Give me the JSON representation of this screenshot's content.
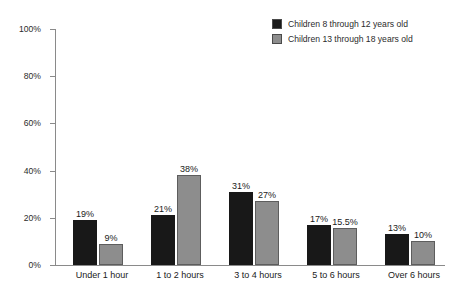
{
  "chart_data": {
    "type": "bar",
    "title": "",
    "xlabel": "",
    "ylabel": "",
    "grid": false,
    "legend_position": "top-right",
    "ylim": [
      0,
      100
    ],
    "y_unit": "%",
    "yticks": [
      "0%",
      "20%",
      "40%",
      "60%",
      "80%",
      "100%"
    ],
    "ytick_values": [
      0,
      20,
      40,
      60,
      80,
      100
    ],
    "categories": [
      "Under 1 hour",
      "1 to 2 hours",
      "3 to 4 hours",
      "5 to 6 hours",
      "Over 6 hours"
    ],
    "series": [
      {
        "name": "Children 8 through 12 years old",
        "color": "#181818",
        "values": [
          19,
          21,
          31,
          17,
          13
        ],
        "labels": [
          "19%",
          "21%",
          "31%",
          "17%",
          "13%"
        ]
      },
      {
        "name": "Children 13 through 18 years old",
        "color": "#8d8d8d",
        "values": [
          9,
          38,
          27,
          15.5,
          10
        ],
        "labels": [
          "9%",
          "38%",
          "27%",
          "15.5%",
          "10%"
        ]
      }
    ]
  },
  "legend": {
    "items": [
      {
        "label": "Children 8 through 12 years old",
        "swatch": "dark"
      },
      {
        "label": "Children 13 through 18 years old",
        "swatch": "light"
      }
    ]
  }
}
